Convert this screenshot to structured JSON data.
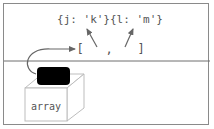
{
  "diagram": {
    "objects_label": "{j: 'k'}{l: 'm'}",
    "array_open": "[",
    "array_comma": ",",
    "array_close": "]",
    "box_label": "array"
  },
  "colors": {
    "frame": "#8a8a8a",
    "divider": "#6e6e6e",
    "text": "#555555",
    "arrow": "#666666",
    "cube_lines": "#bdbdbd",
    "variable_box": "#000000"
  }
}
